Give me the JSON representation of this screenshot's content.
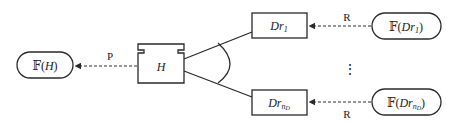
{
  "diagram": {
    "nodes": {
      "f_h": {
        "prefix": "𝔽(",
        "var": "H",
        "suffix": ")"
      },
      "h": {
        "label": "H"
      },
      "dr_1": {
        "base": "Dr",
        "sub": "1"
      },
      "dr_n": {
        "base": "Dr",
        "sub": "n",
        "subsub": "D"
      },
      "f_dr_1": {
        "prefix": "𝔽(",
        "base": "Dr",
        "sub": "1",
        "suffix": ")"
      },
      "f_dr_n": {
        "prefix": "𝔽(",
        "base": "Dr",
        "sub": "n",
        "subsub": "D",
        "suffix": ")"
      }
    },
    "edges": {
      "p_label": "P",
      "r_top_label": "R",
      "r_bottom_label": "R"
    },
    "ellipsis": "⋮"
  }
}
